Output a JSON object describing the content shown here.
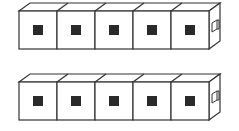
{
  "diagram": {
    "rows": [
      {
        "id": "row-1",
        "cube_count": 5,
        "has_connector": true
      },
      {
        "id": "row-2",
        "cube_count": 5,
        "has_connector": true
      }
    ],
    "colors": {
      "stroke": "#333333",
      "fill": "#ffffff",
      "center_square": "#2a2a2a"
    }
  }
}
